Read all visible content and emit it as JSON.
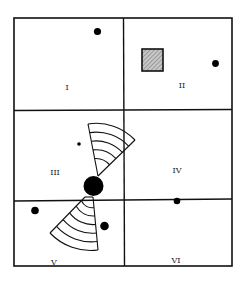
{
  "diagram": {
    "type": "grid-room-layout",
    "colors": {
      "line": "#111111",
      "fill": "#000000",
      "hatch": "#9a9a9a",
      "background": "#ffffff"
    },
    "cells": [
      {
        "id": "I",
        "label": "I"
      },
      {
        "id": "II",
        "label": "II"
      },
      {
        "id": "III",
        "label": "III"
      },
      {
        "id": "IV",
        "label": "IV"
      },
      {
        "id": "V",
        "label": "V"
      },
      {
        "id": "VI",
        "label": "VI"
      }
    ],
    "objects": [
      {
        "type": "dot",
        "cell": "I"
      },
      {
        "type": "hatched-square",
        "cell": "II"
      },
      {
        "type": "dot",
        "cell": "II"
      },
      {
        "type": "small-dot",
        "cell": "III"
      },
      {
        "type": "large-dot",
        "cell": "III"
      },
      {
        "type": "fan-sector",
        "cell": "III",
        "arcs": 5
      },
      {
        "type": "fan-sector",
        "cell": "V",
        "arcs": 6
      },
      {
        "type": "dot",
        "cell": "V"
      },
      {
        "type": "dot",
        "cell": "V"
      },
      {
        "type": "dot",
        "cell": "IV/VI boundary"
      }
    ]
  }
}
